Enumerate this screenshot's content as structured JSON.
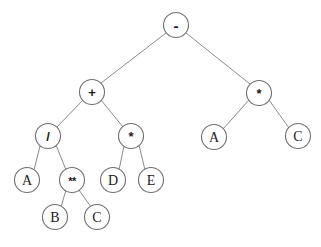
{
  "figure": {
    "expression": "(A / B ** C + D * E) - (A * C)",
    "background_color": "#ffffff",
    "node_fill": "#ffffff",
    "node_stroke": "#6f6f6f",
    "edge_color": "#8a8a8a",
    "label_color": "#1a1a1a"
  },
  "tree": {
    "nodes": [
      {
        "id": "n0",
        "label": "-",
        "kind": "operator",
        "style": "op-minus",
        "x": 176,
        "y": 25,
        "r": 12.5
      },
      {
        "id": "n1",
        "label": "+",
        "kind": "operator",
        "style": "op",
        "x": 92,
        "y": 92,
        "r": 12.5
      },
      {
        "id": "n2",
        "label": "*",
        "kind": "operator",
        "style": "op",
        "x": 259,
        "y": 93,
        "r": 12.5
      },
      {
        "id": "n3",
        "label": "/",
        "kind": "operator",
        "style": "op",
        "x": 48,
        "y": 136,
        "r": 12.5
      },
      {
        "id": "n4",
        "label": "*",
        "kind": "operator",
        "style": "op",
        "x": 131,
        "y": 136,
        "r": 12.5
      },
      {
        "id": "n5",
        "label": "A",
        "kind": "operand",
        "style": "",
        "x": 214,
        "y": 137,
        "r": 12.5
      },
      {
        "id": "n6",
        "label": "C",
        "kind": "operand",
        "style": "",
        "x": 298,
        "y": 136,
        "r": 12.5
      },
      {
        "id": "n7",
        "label": "A",
        "kind": "operand",
        "style": "",
        "x": 27,
        "y": 180,
        "r": 12.5
      },
      {
        "id": "n8",
        "label": "**",
        "kind": "operator",
        "style": "op-pow",
        "x": 72,
        "y": 180,
        "r": 12.5
      },
      {
        "id": "n9",
        "label": "D",
        "kind": "operand",
        "style": "",
        "x": 113,
        "y": 180,
        "r": 12.5
      },
      {
        "id": "n10",
        "label": "E",
        "kind": "operand",
        "style": "",
        "x": 151,
        "y": 180,
        "r": 12.5
      },
      {
        "id": "n11",
        "label": "B",
        "kind": "operand",
        "style": "",
        "x": 55,
        "y": 217,
        "r": 12.5
      },
      {
        "id": "n12",
        "label": "C",
        "kind": "operand",
        "style": "",
        "x": 97,
        "y": 217,
        "r": 12.5
      }
    ],
    "edges": [
      {
        "from": "n0",
        "to": "n1",
        "x1": 166,
        "y1": 33,
        "x2": 101,
        "y2": 83
      },
      {
        "from": "n0",
        "to": "n2",
        "x1": 186,
        "y1": 33,
        "x2": 250,
        "y2": 84
      },
      {
        "from": "n1",
        "to": "n3",
        "x1": 83,
        "y1": 100,
        "x2": 57,
        "y2": 127
      },
      {
        "from": "n1",
        "to": "n4",
        "x1": 101,
        "y1": 100,
        "x2": 123,
        "y2": 127
      },
      {
        "from": "n2",
        "to": "n5",
        "x1": 249,
        "y1": 100,
        "x2": 223,
        "y2": 129
      },
      {
        "from": "n2",
        "to": "n6",
        "x1": 269,
        "y1": 100,
        "x2": 289,
        "y2": 128
      },
      {
        "from": "n3",
        "to": "n7",
        "x1": 40,
        "y1": 146,
        "x2": 34,
        "y2": 170
      },
      {
        "from": "n3",
        "to": "n8",
        "x1": 56,
        "y1": 145,
        "x2": 66,
        "y2": 170
      },
      {
        "from": "n4",
        "to": "n9",
        "x1": 124,
        "y1": 146,
        "x2": 119,
        "y2": 170
      },
      {
        "from": "n4",
        "to": "n10",
        "x1": 139,
        "y1": 145,
        "x2": 145,
        "y2": 170
      },
      {
        "from": "n8",
        "to": "n11",
        "x1": 66,
        "y1": 190,
        "x2": 61,
        "y2": 207
      },
      {
        "from": "n8",
        "to": "n12",
        "x1": 79,
        "y1": 190,
        "x2": 91,
        "y2": 207
      }
    ]
  }
}
